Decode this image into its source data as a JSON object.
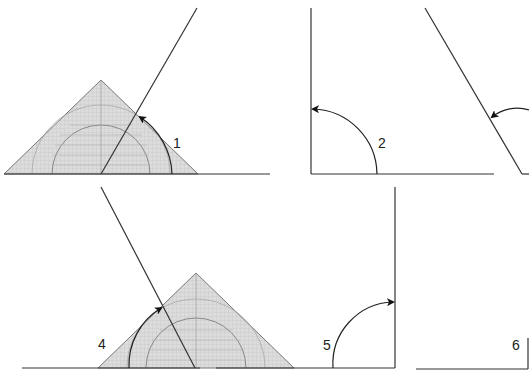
{
  "figure": {
    "colors": {
      "line": "#333333",
      "protractor_fill": "#d8d8d8",
      "protractor_stroke": "#777777",
      "background": "#ffffff"
    },
    "panels": [
      {
        "id": 1,
        "label": "1",
        "type": "protractor-acute"
      },
      {
        "id": 2,
        "label": "2",
        "type": "right-angle-arc"
      },
      {
        "id": 3,
        "label": "",
        "type": "obtuse-line-partial"
      },
      {
        "id": 4,
        "label": "4",
        "type": "protractor-obtuse"
      },
      {
        "id": 5,
        "label": "5",
        "type": "right-angle-arc"
      },
      {
        "id": 6,
        "label": "6",
        "type": "partial"
      }
    ],
    "protractor_ticks": [
      "10",
      "20",
      "30",
      "40",
      "50",
      "60",
      "70",
      "80",
      "90",
      "100",
      "110",
      "120",
      "130",
      "140",
      "150",
      "160",
      "170"
    ]
  }
}
